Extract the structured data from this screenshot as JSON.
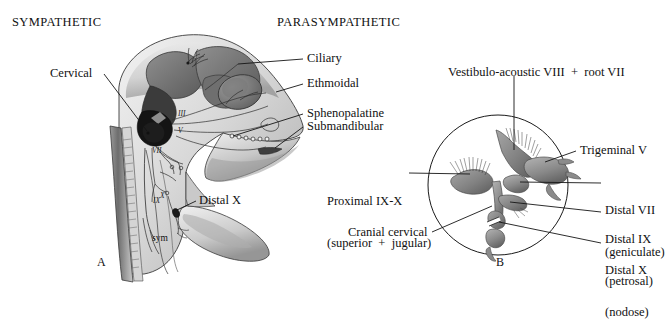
{
  "figure": {
    "headers": {
      "left": "SYMPATHETIC",
      "right": "PARASYMPATHETIC"
    },
    "panel_a": {
      "letter": "A",
      "labels": {
        "cervical": "Cervical",
        "ciliary": "Ciliary",
        "ethmoidal": "Ethmoidal",
        "sphenopalatine": "Sphenopalatine",
        "submandibular": "Submandibular",
        "distal_x": "Distal X"
      },
      "nerve_marks": {
        "iii": "III",
        "v": "V",
        "vii": "VII",
        "ix": "IX",
        "x": "X",
        "sym": "sym"
      }
    },
    "panel_b": {
      "letter": "B",
      "labels": {
        "vestibulo": "Vestibulo-acoustic VIII  +  root VII",
        "trigeminal": "Trigeminal V",
        "proximal_line1": "Proximal IX-X",
        "proximal_line2": "(superior  +  jugular)",
        "distal_vii_line1": "Distal VII",
        "distal_vii_line2": "(geniculate)",
        "distal_ix_line1": "Distal IX",
        "distal_ix_line2": "(petrosal)",
        "distal_x_line1": "Distal X",
        "distal_x_line2": "(nodose)",
        "cranial_cervical": "Cranial cervical"
      }
    },
    "colors": {
      "ink": "#111111",
      "leader": "#1a1a1a",
      "outline": "#2b2b2b",
      "tissue_light": "#e9e9e9",
      "tissue_mid": "#bdbdbd",
      "tissue_dark": "#8d8d8d",
      "tissue_darker": "#5e5e5e",
      "nerve_black": "#141414"
    }
  }
}
